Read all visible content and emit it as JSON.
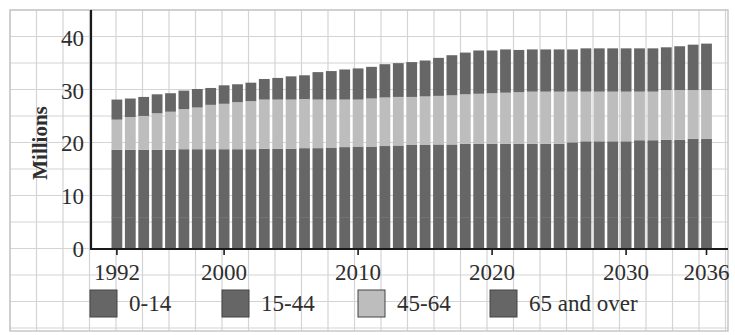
{
  "chart_data": {
    "type": "bar",
    "stacked": true,
    "title": "",
    "xlabel": "",
    "ylabel": "Millions",
    "ylim": [
      0,
      45
    ],
    "yticks": [
      0,
      10,
      20,
      30,
      40
    ],
    "xtick_labels": [
      "1992",
      "2000",
      "2010",
      "2020",
      "2030",
      "2036"
    ],
    "grid": true,
    "legend_position": "bottom",
    "categories": [
      1992,
      1993,
      1994,
      1995,
      1996,
      1997,
      1998,
      1999,
      2000,
      2001,
      2002,
      2003,
      2004,
      2005,
      2006,
      2007,
      2008,
      2009,
      2010,
      2011,
      2012,
      2013,
      2014,
      2015,
      2016,
      2017,
      2018,
      2019,
      2020,
      2021,
      2022,
      2023,
      2024,
      2025,
      2026,
      2027,
      2028,
      2029,
      2030,
      2031,
      2032,
      2033,
      2034,
      2035,
      2036
    ],
    "series": [
      {
        "name": "0-14",
        "color": "#666666",
        "values": [
          6.0,
          6.0,
          6.0,
          6.0,
          6.0,
          6.0,
          6.0,
          6.0,
          6.0,
          6.0,
          6.0,
          6.0,
          6.0,
          6.0,
          6.0,
          6.0,
          6.0,
          6.0,
          6.0,
          6.0,
          6.0,
          6.0,
          6.0,
          6.0,
          6.0,
          6.0,
          6.0,
          6.0,
          6.0,
          6.0,
          6.0,
          6.0,
          6.0,
          6.0,
          6.0,
          6.0,
          6.0,
          6.0,
          6.0,
          6.0,
          6.0,
          6.0,
          6.0,
          6.0,
          6.0
        ]
      },
      {
        "name": "15-44",
        "color": "#666666",
        "values": [
          12.8,
          12.8,
          12.8,
          12.8,
          12.8,
          12.9,
          12.9,
          12.9,
          12.9,
          12.9,
          12.9,
          13.0,
          13.0,
          13.0,
          13.1,
          13.1,
          13.2,
          13.3,
          13.4,
          13.4,
          13.5,
          13.6,
          13.7,
          13.7,
          13.8,
          13.8,
          13.9,
          13.9,
          13.9,
          13.9,
          13.9,
          13.9,
          13.9,
          13.9,
          14.2,
          14.4,
          14.4,
          14.4,
          14.4,
          14.6,
          14.6,
          14.7,
          14.7,
          14.9,
          14.9
        ]
      },
      {
        "name": "45-64",
        "color": "#bdbdbd",
        "values": [
          5.7,
          6.2,
          6.4,
          6.9,
          7.2,
          7.6,
          7.9,
          8.4,
          8.6,
          8.9,
          9.1,
          9.3,
          9.3,
          9.3,
          9.3,
          9.2,
          9.1,
          9.0,
          8.9,
          9.1,
          9.2,
          9.2,
          9.1,
          9.2,
          9.2,
          9.3,
          9.4,
          9.5,
          9.6,
          9.7,
          9.8,
          9.9,
          9.9,
          9.9,
          9.6,
          9.4,
          9.4,
          9.4,
          9.4,
          9.2,
          9.2,
          9.4,
          9.4,
          9.2,
          9.2
        ]
      },
      {
        "name": "65 and over",
        "color": "#666666",
        "values": [
          3.8,
          3.5,
          3.6,
          3.6,
          3.5,
          3.5,
          3.5,
          3.2,
          3.5,
          3.4,
          3.5,
          3.9,
          4.1,
          4.4,
          4.5,
          5.2,
          5.4,
          5.7,
          5.9,
          6.0,
          6.3,
          6.4,
          6.6,
          6.8,
          7.2,
          7.6,
          7.9,
          8.2,
          8.1,
          8.2,
          8.0,
          8.0,
          8.0,
          8.0,
          8.0,
          8.2,
          8.2,
          8.2,
          8.2,
          8.2,
          8.2,
          8.1,
          8.3,
          8.6,
          8.8
        ]
      }
    ]
  },
  "legend": {
    "items": [
      {
        "label": "0-14",
        "color": "#666666"
      },
      {
        "label": "15-44",
        "color": "#666666"
      },
      {
        "label": "45-64",
        "color": "#bdbdbd"
      },
      {
        "label": "65 and over",
        "color": "#666666"
      }
    ]
  },
  "axis": {
    "ylabel": "Millions"
  }
}
